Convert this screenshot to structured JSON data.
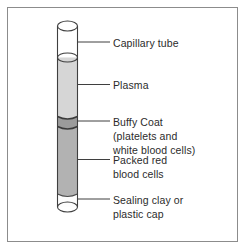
{
  "colors": {
    "frame_border": "#8c8c8c",
    "tube_outline": "#3f3f3f",
    "tube_empty": "#ffffff",
    "meniscus": "#e4e4e4",
    "plasma": "#d6d6d6",
    "buffy_coat": "#9b9b9b",
    "packed_cells": "#b2b2b2",
    "sealing_clay": "#fdfdfd",
    "leader_line": "#3f3f3f",
    "label_text": "#2b2b2b"
  },
  "labels": {
    "capillary_tube": {
      "lines": [
        "Capillary tube"
      ]
    },
    "plasma": {
      "lines": [
        "Plasma"
      ]
    },
    "buffy_coat": {
      "lines": [
        "Buffy Coat",
        "(platelets and",
        "white blood cells)"
      ]
    },
    "packed_red": {
      "lines": [
        "Packed red",
        "blood cells"
      ]
    },
    "sealing_clay": {
      "lines": [
        "Sealing clay or",
        "plastic cap"
      ]
    }
  }
}
